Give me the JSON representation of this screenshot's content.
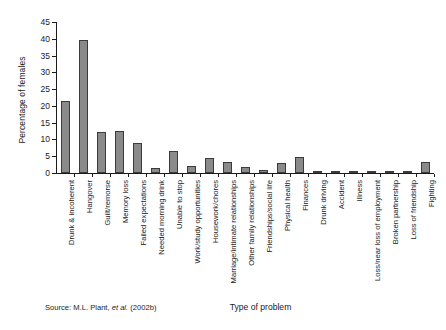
{
  "chart_data": {
    "type": "bar",
    "title": "",
    "xlabel": "Type of problem",
    "ylabel": "Percentage of females",
    "ylim": [
      0,
      45
    ],
    "ytick_labels": [
      "0",
      "5",
      "10",
      "15",
      "20",
      "25",
      "30",
      "35",
      "40",
      "45"
    ],
    "ytick_values": [
      0,
      5,
      10,
      15,
      20,
      25,
      30,
      35,
      40,
      45
    ],
    "grid": false,
    "legend": "none",
    "categories": [
      "Drunk & incoherent",
      "Hangover",
      "Guilt/remorse",
      "Memory loss",
      "Failed expectations",
      "Needed morning drink",
      "Unable to stop",
      "Work/study opportunities",
      "Housework/chores",
      "Marriage/intimate relationships",
      "Other family relationships",
      "Friendships/social life",
      "Physical health",
      "Finances",
      "Drunk driving",
      "Accident",
      "Illness",
      "Loss/near loss of employment",
      "Broken partnership",
      "Loss of friendship",
      "Fighting"
    ],
    "values": [
      21.5,
      39.5,
      12.2,
      12.4,
      9.0,
      1.5,
      6.5,
      2.0,
      4.5,
      3.2,
      1.7,
      0.9,
      3.0,
      4.7,
      0.3,
      0.3,
      0.4,
      0.15,
      0.7,
      0.6,
      3.4
    ],
    "bar_color": "#8a8a8a",
    "bar_edge_color": "#3b3b3b"
  },
  "footer": {
    "source_prefix": "Source: M.L. Plant, ",
    "source_italic": "et al.",
    "source_suffix": " (2002b)",
    "source_full": "Source: M.L. Plant, et al. (2002b)"
  }
}
